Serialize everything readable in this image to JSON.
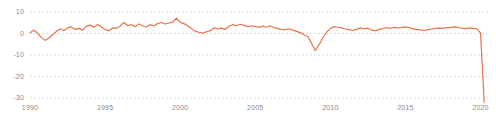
{
  "chart_data": {
    "type": "line",
    "title": "",
    "subtitle": "",
    "xlabel": "",
    "ylabel": "",
    "xlim": [
      1990,
      2020.5
    ],
    "ylim": [
      -33,
      12
    ],
    "yticks": [
      10,
      0,
      -10,
      -20,
      -30
    ],
    "ytick_labels": [
      "10",
      "0",
      "-10",
      "-20",
      "-30"
    ],
    "xticks": [
      1990,
      1995,
      2000,
      2005,
      2010,
      2015,
      2020
    ],
    "xtick_labels": [
      "1990",
      "1995",
      "2000",
      "2005",
      "2010",
      "2015",
      "2020"
    ],
    "grid": true,
    "grid_style": "dashed",
    "grid_color": "#cccccc",
    "legend": false,
    "legend_position": "none",
    "line_color": "#e8734a",
    "line_width": 1.2,
    "series": [
      {
        "name": "value",
        "x": [
          1990.0,
          1990.25,
          1990.5,
          1990.75,
          1991.0,
          1991.25,
          1991.5,
          1991.75,
          1992.0,
          1992.25,
          1992.5,
          1992.75,
          1993.0,
          1993.25,
          1993.5,
          1993.75,
          1994.0,
          1994.25,
          1994.5,
          1994.75,
          1995.0,
          1995.25,
          1995.5,
          1995.75,
          1996.0,
          1996.25,
          1996.5,
          1996.75,
          1997.0,
          1997.25,
          1997.5,
          1997.75,
          1998.0,
          1998.25,
          1998.5,
          1998.75,
          1999.0,
          1999.25,
          1999.5,
          1999.75,
          2000.0,
          2000.25,
          2000.5,
          2000.75,
          2001.0,
          2001.25,
          2001.5,
          2001.75,
          2002.0,
          2002.25,
          2002.5,
          2002.75,
          2003.0,
          2003.25,
          2003.5,
          2003.75,
          2004.0,
          2004.25,
          2004.5,
          2004.75,
          2005.0,
          2005.25,
          2005.5,
          2005.75,
          2006.0,
          2006.25,
          2006.5,
          2006.75,
          2007.0,
          2007.25,
          2007.5,
          2007.75,
          2008.0,
          2008.25,
          2008.5,
          2008.75,
          2009.0,
          2009.25,
          2009.5,
          2009.75,
          2010.0,
          2010.25,
          2010.5,
          2010.75,
          2011.0,
          2011.25,
          2011.5,
          2011.75,
          2012.0,
          2012.25,
          2012.5,
          2012.75,
          2013.0,
          2013.25,
          2013.5,
          2013.75,
          2014.0,
          2014.25,
          2014.5,
          2014.75,
          2015.0,
          2015.25,
          2015.5,
          2015.75,
          2016.0,
          2016.25,
          2016.5,
          2016.75,
          2017.0,
          2017.25,
          2017.5,
          2017.75,
          2018.0,
          2018.25,
          2018.5,
          2018.75,
          2019.0,
          2019.25,
          2019.5,
          2019.75,
          2020.0,
          2020.25
        ],
        "values": [
          0.3,
          1.5,
          0.2,
          -1.8,
          -3.2,
          -2.2,
          -0.6,
          0.9,
          2.1,
          1.4,
          2.6,
          3.1,
          1.9,
          2.4,
          1.6,
          3.4,
          3.9,
          2.9,
          4.2,
          3.1,
          1.8,
          1.3,
          2.6,
          2.4,
          3.4,
          5.2,
          3.7,
          4.1,
          3.2,
          4.4,
          3.6,
          3.0,
          4.1,
          3.5,
          4.6,
          5.1,
          4.4,
          4.9,
          5.3,
          7.1,
          5.2,
          4.6,
          3.6,
          2.3,
          1.1,
          0.6,
          0.2,
          0.8,
          1.3,
          2.6,
          2.1,
          2.5,
          1.9,
          3.4,
          4.1,
          3.6,
          4.3,
          3.8,
          3.2,
          3.6,
          3.3,
          2.8,
          3.4,
          2.9,
          3.6,
          2.7,
          2.3,
          1.9,
          1.8,
          2.2,
          1.6,
          1.0,
          0.4,
          -0.6,
          -1.4,
          -4.6,
          -7.9,
          -5.2,
          -2.1,
          0.6,
          2.3,
          3.2,
          2.9,
          2.6,
          2.1,
          1.8,
          1.4,
          1.9,
          2.6,
          2.2,
          2.5,
          1.6,
          1.3,
          1.9,
          2.3,
          2.8,
          2.4,
          2.9,
          2.6,
          2.7,
          3.1,
          2.8,
          2.3,
          1.9,
          1.7,
          1.4,
          1.8,
          2.1,
          2.3,
          2.6,
          2.4,
          2.8,
          2.7,
          3.1,
          2.9,
          2.5,
          2.3,
          2.6,
          2.4,
          2.3,
          0.3,
          -32.0
        ]
      }
    ]
  }
}
